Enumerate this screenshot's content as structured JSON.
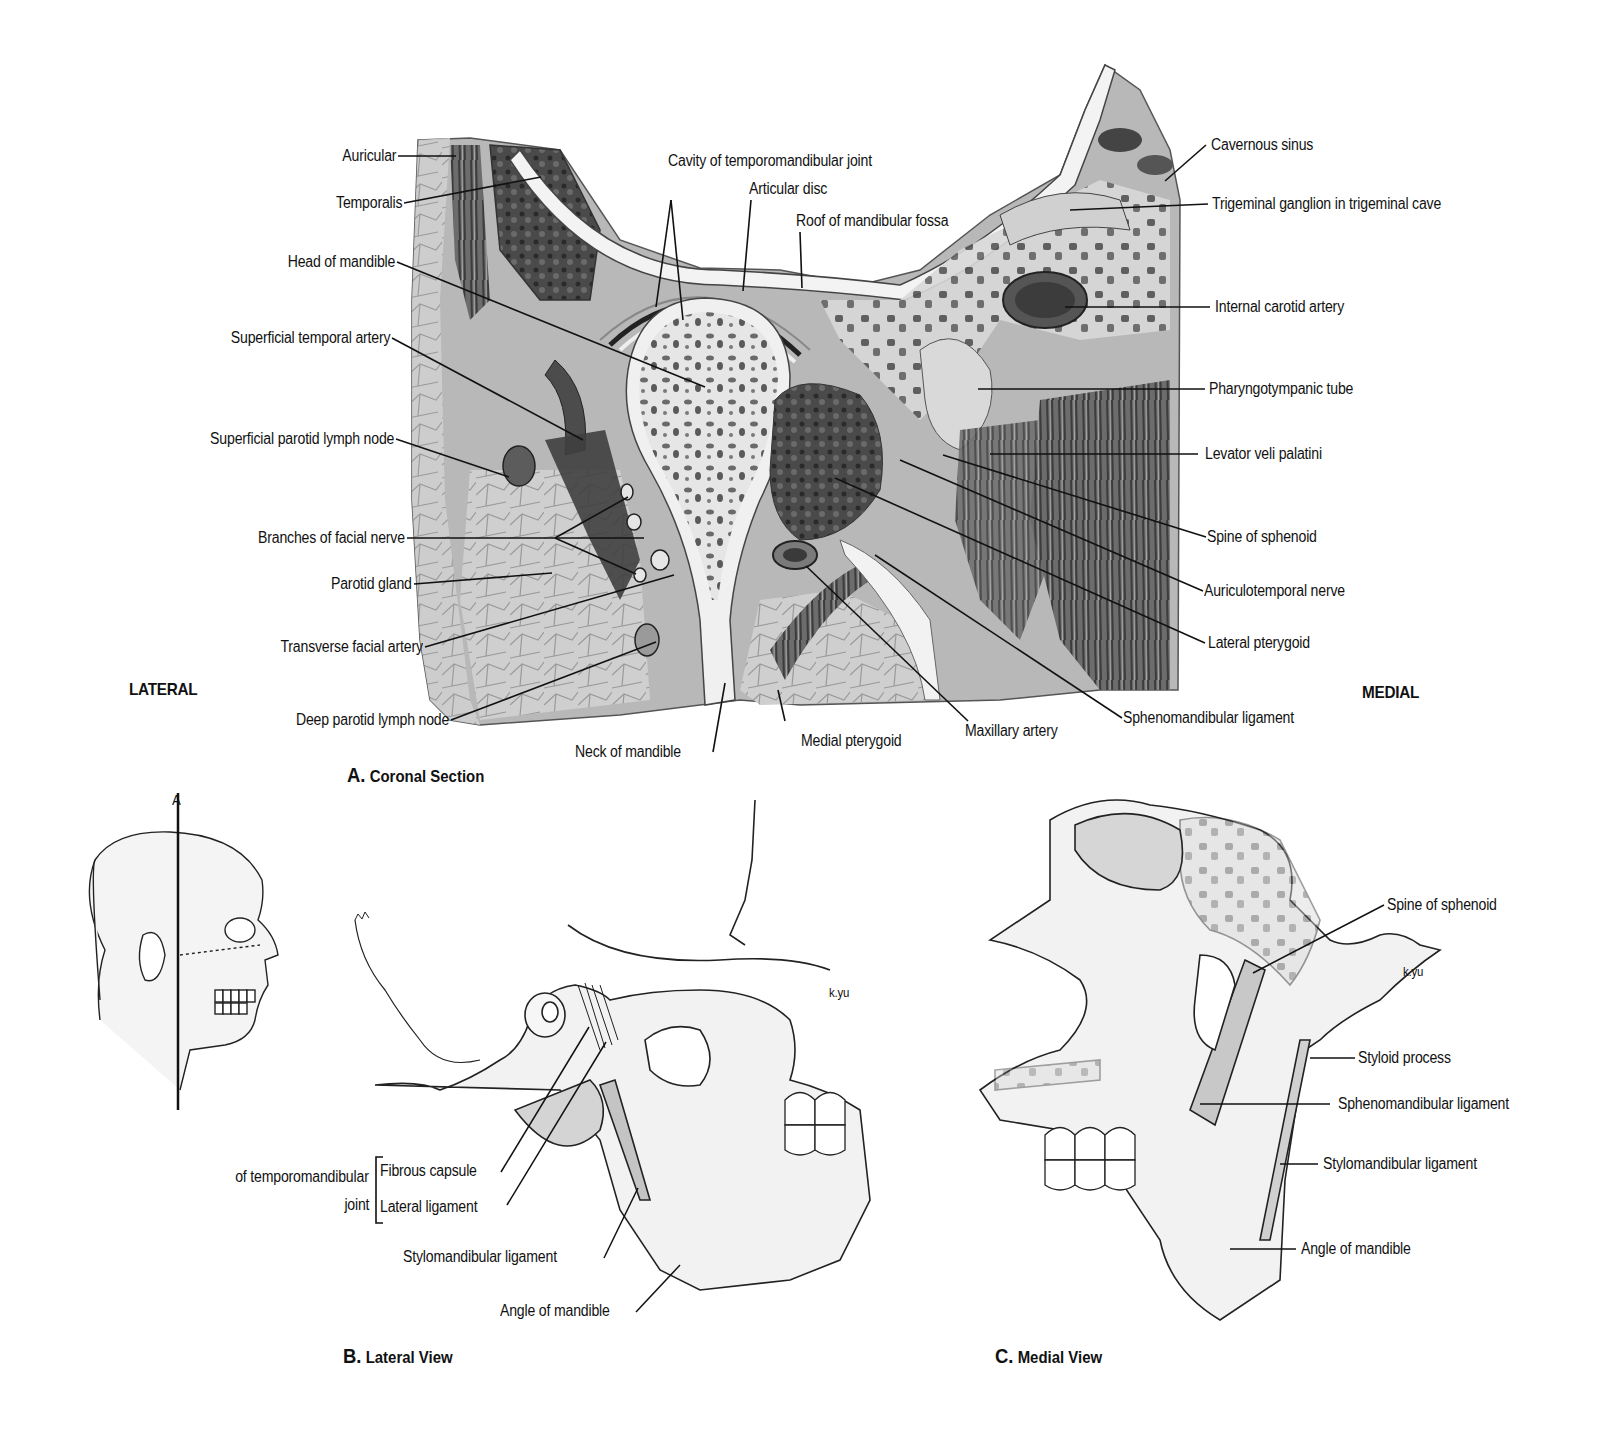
{
  "panel_a": {
    "caption_letter": "A.",
    "caption_title": "Coronal Section",
    "orient_left": "LATERAL",
    "orient_right": "MEDIAL",
    "labels_left": [
      "Auricular",
      "Temporalis",
      "Head of mandible",
      "Superficial temporal artery",
      "Superficial parotid lymph node",
      "Branches of facial nerve",
      "Parotid gland",
      "Transverse facial artery",
      "Deep parotid lymph node"
    ],
    "labels_top": [
      "Cavity of temporomandibular joint",
      "Articular disc",
      "Roof of mandibular fossa"
    ],
    "labels_right": [
      "Cavernous sinus",
      "Trigeminal ganglion in trigeminal cave",
      "Internal carotid artery",
      "Pharyngotympanic tube",
      "Levator veli palatini",
      "Spine of sphenoid",
      "Auriculotemporal nerve",
      "Lateral pterygoid",
      "Sphenomandibular ligament"
    ],
    "labels_bottom": [
      "Neck of mandible",
      "Medial pterygoid",
      "Maxillary artery"
    ]
  },
  "orientation_figure": {
    "plane_label": "A"
  },
  "panel_b": {
    "caption_letter": "B.",
    "caption_title": "Lateral View",
    "bracket_prefix_line1": "of temporomandibular",
    "bracket_prefix_line2": "joint",
    "labels": [
      "Fibrous capsule",
      "Lateral ligament",
      "Stylomandibular ligament",
      "Angle of mandible"
    ],
    "signature": "k.yu"
  },
  "panel_c": {
    "caption_letter": "C.",
    "caption_title": "Medial View",
    "labels": [
      "Spine of sphenoid",
      "Styloid process",
      "Sphenomandibular ligament",
      "Stylomandibular ligament",
      "Angle of mandible"
    ],
    "signature": "k.yu"
  }
}
